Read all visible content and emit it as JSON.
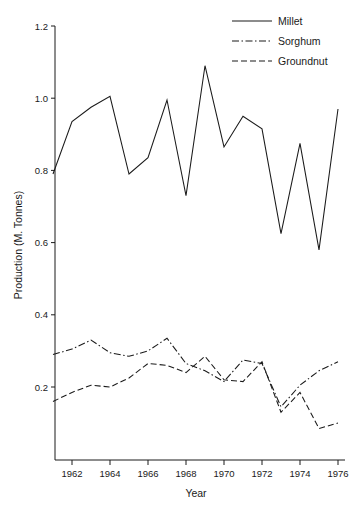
{
  "chart_data": {
    "type": "line",
    "title": "",
    "xlabel": "Year",
    "ylabel": "Production (M. Tonnes)",
    "xlim": [
      1961,
      1976
    ],
    "ylim": [
      0.08,
      1.2
    ],
    "grid": false,
    "legend_position": "top-right",
    "x": [
      1961,
      1962,
      1963,
      1964,
      1965,
      1966,
      1967,
      1968,
      1969,
      1970,
      1971,
      1972,
      1973,
      1974,
      1975,
      1976
    ],
    "xticks": [
      1962,
      1964,
      1966,
      1968,
      1970,
      1972,
      1974,
      1976
    ],
    "xtick_labels": [
      "1962",
      "1964",
      "1966",
      "1968",
      "1970",
      "1972",
      "1974",
      "1976"
    ],
    "yticks": [
      0.2,
      0.4,
      0.6,
      0.8,
      1.0,
      1.2
    ],
    "ytick_labels": [
      "0.2",
      "0.4",
      "0.6",
      "0.8",
      "1.0",
      "1.2"
    ],
    "series": [
      {
        "name": "Millet",
        "style": "solid",
        "values": [
          0.79,
          0.935,
          0.975,
          1.005,
          0.79,
          0.835,
          0.995,
          0.73,
          1.09,
          0.865,
          0.95,
          0.915,
          0.625,
          0.875,
          0.58,
          0.97
        ]
      },
      {
        "name": "Sorghum",
        "style": "dashdot",
        "values": [
          0.29,
          0.305,
          0.33,
          0.295,
          0.285,
          0.3,
          0.335,
          0.265,
          0.245,
          0.215,
          0.275,
          0.265,
          0.145,
          0.205,
          0.245,
          0.27
        ]
      },
      {
        "name": "Groundnut",
        "style": "dashed",
        "values": [
          0.16,
          0.185,
          0.205,
          0.2,
          0.225,
          0.265,
          0.26,
          0.24,
          0.285,
          0.22,
          0.215,
          0.27,
          0.13,
          0.185,
          0.085,
          0.1
        ]
      }
    ]
  },
  "legend": {
    "items": [
      {
        "label": "Millet"
      },
      {
        "label": "Sorghum"
      },
      {
        "label": "Groundnut"
      }
    ]
  }
}
